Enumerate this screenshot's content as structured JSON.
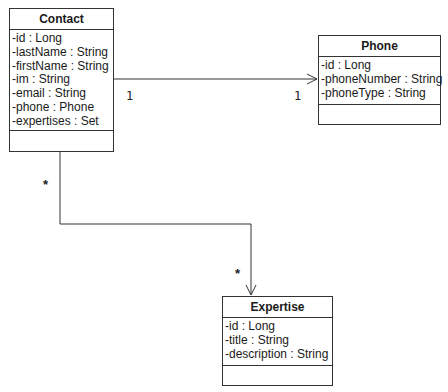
{
  "diagram": {
    "type": "UML class diagram",
    "classes": [
      {
        "name": "Contact",
        "attributes": [
          "-id : Long",
          "-lastName : String",
          "-firstName : String",
          "-im : String",
          "-email : String",
          "-phone : Phone",
          "-expertises : Set"
        ],
        "operations": []
      },
      {
        "name": "Phone",
        "attributes": [
          "-id : Long",
          "-phoneNumber : String",
          "-phoneType : String"
        ],
        "operations": []
      },
      {
        "name": "Expertise",
        "attributes": [
          "-id : Long",
          "-title : String",
          "-description : String"
        ],
        "operations": []
      }
    ],
    "associations": [
      {
        "from": "Contact",
        "to": "Phone",
        "from_multiplicity": "1",
        "to_multiplicity": "1",
        "navigable_to": "Phone"
      },
      {
        "from": "Contact",
        "to": "Expertise",
        "from_multiplicity": "*",
        "to_multiplicity": "*",
        "navigable_to": "Expertise"
      }
    ]
  },
  "colors": {
    "line": "#333333",
    "background": "#ffffff",
    "text": "#1a1a1a"
  }
}
